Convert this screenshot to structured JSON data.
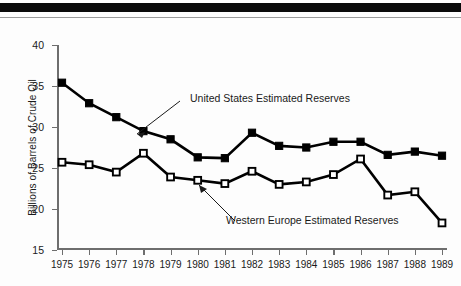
{
  "chart_data": {
    "type": "line",
    "title": "",
    "xlabel": "",
    "ylabel": "Billions of Barrels of Crude Oil",
    "x": [
      1975,
      1976,
      1977,
      1978,
      1979,
      1980,
      1981,
      1982,
      1983,
      1984,
      1985,
      1986,
      1987,
      1988,
      1989
    ],
    "xtick_labels": [
      "1975",
      "1976",
      "1977",
      "1978",
      "1979",
      "1980",
      "1981",
      "1982",
      "1983",
      "1984",
      "1985",
      "1986",
      "1987",
      "1988",
      "1989"
    ],
    "ytick_labels": [
      "40",
      "35",
      "30",
      "25",
      "20",
      "15"
    ],
    "ytick_values": [
      40,
      35,
      30,
      25,
      20,
      15
    ],
    "ylim": [
      15,
      40
    ],
    "grid": false,
    "legend_position": "inline-annotations",
    "series": [
      {
        "name": "United States Estimated Reserves",
        "marker": "filled-square",
        "color": "#000000",
        "values": [
          35.4,
          32.9,
          31.2,
          29.5,
          28.5,
          26.3,
          26.2,
          29.3,
          27.7,
          27.5,
          28.2,
          28.2,
          26.6,
          27.0,
          26.5
        ]
      },
      {
        "name": "Western Europe Estimated Reserves",
        "marker": "open-square",
        "color": "#000000",
        "values": [
          25.7,
          25.4,
          24.5,
          26.8,
          23.9,
          23.5,
          23.1,
          24.6,
          23.0,
          23.3,
          24.2,
          26.1,
          21.7,
          22.1,
          18.3
        ]
      }
    ],
    "annotations": [
      {
        "text": "United States Estimated Reserves",
        "points_to_year": 1978
      },
      {
        "text": "Western Europe Estimated Reserves",
        "points_to_year": 1980
      }
    ]
  }
}
